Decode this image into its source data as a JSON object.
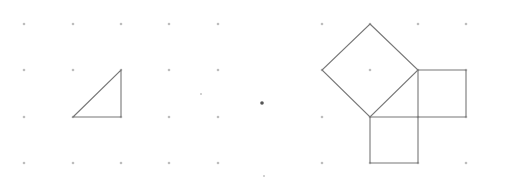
{
  "diagram": {
    "colors": {
      "dot": "#bdbdbd",
      "line": "#777777",
      "background": "#ffffff"
    },
    "left_grid": {
      "xs": [
        24,
        73,
        121,
        169,
        218
      ],
      "ys": [
        24,
        70,
        117,
        163
      ]
    },
    "right_grid": {
      "xs": [
        322,
        370,
        418,
        466
      ],
      "ys": [
        24,
        70,
        117,
        163
      ]
    },
    "left_triangle": [
      [
        73,
        117
      ],
      [
        121,
        70
      ],
      [
        121,
        117
      ]
    ],
    "right_figure": {
      "hypotenuse_square": [
        [
          370,
          24
        ],
        [
          418,
          70
        ],
        [
          370,
          117
        ],
        [
          322,
          70
        ]
      ],
      "vertical_leg_square": [
        [
          418,
          70
        ],
        [
          466,
          70
        ],
        [
          466,
          117
        ],
        [
          418,
          117
        ]
      ],
      "horizontal_leg_square": [
        [
          370,
          117
        ],
        [
          418,
          117
        ],
        [
          418,
          163
        ],
        [
          370,
          163
        ]
      ]
    },
    "stray_marks": [
      [
        201,
        94
      ],
      [
        262,
        103
      ],
      [
        264,
        176
      ]
    ]
  }
}
